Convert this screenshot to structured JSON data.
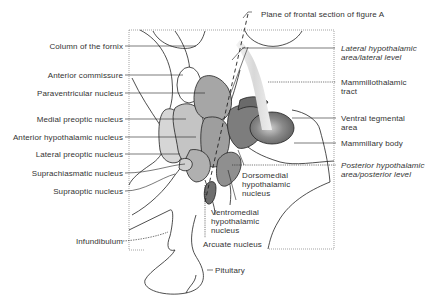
{
  "figure": {
    "title_label": "Plane of frontal section of figure A",
    "left_labels": [
      {
        "id": "column-of-fornix",
        "text": "Column of the fornix"
      },
      {
        "id": "anterior-commissure",
        "text": "Anterior commissure"
      },
      {
        "id": "paraventricular-nucleus",
        "text": "Paraventricular nucleus"
      },
      {
        "id": "medial-preoptic-nucleus",
        "text": "Medial preoptic nucleus"
      },
      {
        "id": "anterior-hypothalamic-nucleus",
        "text": "Anterior hypothalamic nucleus"
      },
      {
        "id": "lateral-preoptic-nucleus",
        "text": "Lateral preoptic nucleus"
      },
      {
        "id": "suprachiasmatic-nucleus",
        "text": "Suprachiasmatic nucleus"
      },
      {
        "id": "supraoptic-nucleus",
        "text": "Supraoptic nucleus"
      },
      {
        "id": "infundibulum",
        "text": "Infundibulum"
      }
    ],
    "right_labels": [
      {
        "id": "lateral-hypothalamic-area",
        "line1": "Lateral hypothalamic",
        "line2": "area/lateral level",
        "italic": true
      },
      {
        "id": "mammillothalamic-tract",
        "line1": "Mammillothalamic",
        "line2": "tract",
        "italic": false
      },
      {
        "id": "ventral-tegmental-area",
        "line1": "Ventral tegmental",
        "line2": "area",
        "italic": false
      },
      {
        "id": "mammillary-body",
        "line1": "Mammillary body",
        "line2": "",
        "italic": false
      },
      {
        "id": "posterior-hypothalamic-area",
        "line1": "Posterior hypothalamic",
        "line2": "area/posterior level",
        "italic": true
      }
    ],
    "inner_labels": [
      {
        "id": "dorsomedial-hypothalamic-nucleus",
        "lines": [
          "Dorsomedial",
          "hypothalamic",
          "nucleus"
        ]
      },
      {
        "id": "ventromedial-hypothalamic-nucleus",
        "lines": [
          "Ventromedial",
          "hypothalamic",
          "nucleus"
        ]
      }
    ],
    "bottom_labels": [
      {
        "id": "arcuate-nucleus",
        "text": "Arcuate nucleus"
      },
      {
        "id": "pituitary",
        "text": "Pituitary"
      }
    ],
    "colors": {
      "line": "#222222",
      "label_text": "#333333",
      "light_gray": "#c9c9c9",
      "mid_gray": "#9a9a9a",
      "dark_gray": "#6e6e6e",
      "lightest_gray": "#dcdcdc",
      "tract_fill": "#e2e2e2"
    }
  }
}
